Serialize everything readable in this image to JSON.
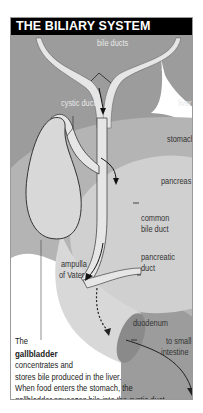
{
  "title": "THE BILIARY SYSTEM",
  "labels": {
    "bile_ducts": "bile ducts",
    "cystic_duct": "cystic duct",
    "liver": "liver",
    "stomach": "stomach",
    "pancreas": "pancreas",
    "common_bile_duct_1": "common",
    "common_bile_duct_2": "bile duct",
    "pancreatic_duct_1": "pancreatic",
    "pancreatic_duct_2": "duct",
    "ampulla_1": "ampulla",
    "ampulla_2": "of Vater",
    "duodenum": "duodenum",
    "to_small_1": "to small",
    "to_small_2": "intestine"
  },
  "caption": {
    "line1": "The",
    "line2_bold": "gallbladder",
    "line3": "concentrates and",
    "line4": "stores bile produced in the liver.",
    "line5": "When food enters the stomach, the",
    "line6": "gallbladder squeezes bile into the cystic duct."
  },
  "colors": {
    "header_bg": "#000000",
    "liver": "#9c9c9c",
    "stomach": "#b4b4b4",
    "pancreas": "#d0d0d0",
    "duct_fill": "#e6e6e6",
    "duodenum_end": "#8a8a8a"
  }
}
